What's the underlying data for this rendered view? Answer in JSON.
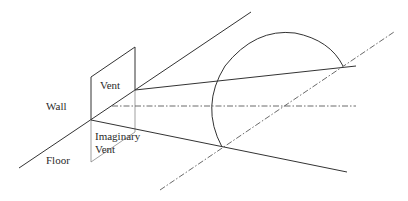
{
  "diagram": {
    "labels": {
      "wall": "Wall",
      "floor": "Floor",
      "vent": "Vent",
      "imaginary_vent_line1": "Imaginary",
      "imaginary_vent_line2": "Vent"
    }
  }
}
